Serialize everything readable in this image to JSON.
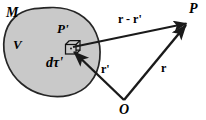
{
  "figure": {
    "name": "magnetized-body-vector-diagram",
    "background_color": "#ffffff",
    "ink_color": "#1a1a1a",
    "body_fill_color": "#c9c9c9",
    "body_stroke_color": "#262626",
    "labels": {
      "material_body": "M",
      "volume": "V",
      "source_point": "P'",
      "volume_element": "dτ'",
      "field_point": "P",
      "origin": "O",
      "separation_vector": "r - r'",
      "source_vector": "r'",
      "field_vector": "r"
    },
    "geometry": {
      "origin_point": "O",
      "field_point": "P",
      "source_point": "P'",
      "vectors": [
        {
          "name": "r - r'",
          "from": "P'",
          "to": "P"
        },
        {
          "name": "r'",
          "from": "O",
          "to": "P'"
        },
        {
          "name": "r",
          "from": "O",
          "to": "P"
        }
      ]
    }
  }
}
